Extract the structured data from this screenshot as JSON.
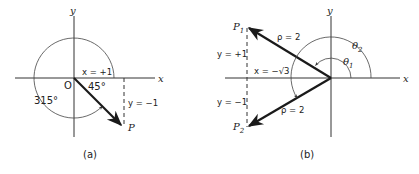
{
  "panel_a": {
    "caption": "(a)",
    "axis_x": "x",
    "axis_y": "y",
    "origin": "O",
    "point": "P",
    "x_label": "x = +1",
    "y_label": "y = −1",
    "angle_small": "45°",
    "angle_large": "315°"
  },
  "panel_b": {
    "caption": "(b)",
    "axis_x": "x",
    "axis_y": "y",
    "point1": "P",
    "point1_sub": "1",
    "point2": "P",
    "point2_sub": "2",
    "rho1": "ρ = 2",
    "rho2": "ρ = 2",
    "y_pos_label": "y = +1",
    "y_neg_label": "y = −1",
    "x_label": "x = −√3",
    "theta1": "θ",
    "theta1_sub": "1",
    "theta2": "θ",
    "theta2_sub": "2"
  }
}
